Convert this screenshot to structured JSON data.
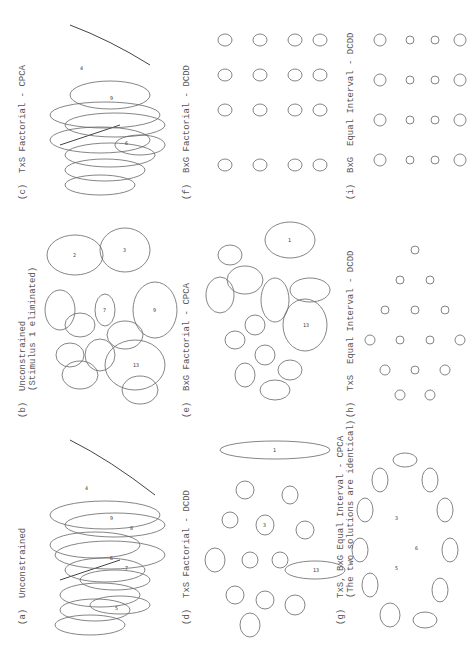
{
  "figure": {
    "panels": [
      {
        "id": "a",
        "label": "(a)  Unconstrained"
      },
      {
        "id": "b",
        "label": "(b)  Unconstrained\n     (Stimulus 1 eliminated)"
      },
      {
        "id": "c",
        "label": "(c)  TxS Factorial - CPCA"
      },
      {
        "id": "d",
        "label": "(d)  TxS Factorial - DCDD"
      },
      {
        "id": "e",
        "label": "(e)  BxG Factorial - CPCA"
      },
      {
        "id": "f",
        "label": "(f)  BxG Factorial - DCDD"
      },
      {
        "id": "g",
        "label": "(g)  TxS, BxG Equal Interval - CPCA\n     (The two solutions are identical)"
      },
      {
        "id": "h",
        "label": "(h)  TxS  Equal Interval - DCDD"
      },
      {
        "id": "i",
        "label": "(i)  BxG  Equal Interval - DCDD"
      }
    ]
  }
}
